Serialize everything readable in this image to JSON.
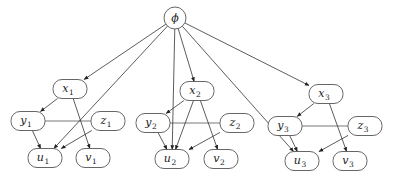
{
  "diagram": {
    "type": "graphical-model",
    "root": {
      "id": "phi",
      "label": "ϕ",
      "x": 175,
      "y": 18,
      "r": 11
    },
    "nodes": [
      {
        "id": "x1",
        "base": "x",
        "sub": "1",
        "x": 70,
        "y": 89
      },
      {
        "id": "y1",
        "base": "y",
        "sub": "1",
        "x": 28,
        "y": 121
      },
      {
        "id": "z1",
        "base": "z",
        "sub": "1",
        "x": 108,
        "y": 121
      },
      {
        "id": "u1",
        "base": "u",
        "sub": "1",
        "x": 45,
        "y": 158
      },
      {
        "id": "v1",
        "base": "v",
        "sub": "1",
        "x": 93,
        "y": 158
      },
      {
        "id": "x2",
        "base": "x",
        "sub": "2",
        "x": 197,
        "y": 91
      },
      {
        "id": "y2",
        "base": "y",
        "sub": "2",
        "x": 153,
        "y": 123
      },
      {
        "id": "z2",
        "base": "z",
        "sub": "2",
        "x": 237,
        "y": 123
      },
      {
        "id": "u2",
        "base": "u",
        "sub": "2",
        "x": 172,
        "y": 159
      },
      {
        "id": "v2",
        "base": "v",
        "sub": "2",
        "x": 221,
        "y": 159
      },
      {
        "id": "x3",
        "base": "x",
        "sub": "3",
        "x": 326,
        "y": 94
      },
      {
        "id": "y3",
        "base": "y",
        "sub": "3",
        "x": 285,
        "y": 126
      },
      {
        "id": "z3",
        "base": "z",
        "sub": "3",
        "x": 365,
        "y": 126
      },
      {
        "id": "u3",
        "base": "u",
        "sub": "3",
        "x": 302,
        "y": 161
      },
      {
        "id": "v3",
        "base": "v",
        "sub": "3",
        "x": 350,
        "y": 161
      }
    ],
    "directed_edges": [
      [
        "phi",
        "x1"
      ],
      [
        "phi",
        "u1"
      ],
      [
        "phi",
        "x2"
      ],
      [
        "phi",
        "u2"
      ],
      [
        "phi",
        "x3"
      ],
      [
        "phi",
        "u3"
      ],
      [
        "x1",
        "y1"
      ],
      [
        "x1",
        "v1"
      ],
      [
        "y1",
        "u1"
      ],
      [
        "z1",
        "u1"
      ],
      [
        "x2",
        "y2"
      ],
      [
        "x2",
        "v2"
      ],
      [
        "x2",
        "u2"
      ],
      [
        "y2",
        "u2"
      ],
      [
        "z2",
        "u2"
      ],
      [
        "x3",
        "y3"
      ],
      [
        "x3",
        "v3"
      ],
      [
        "y3",
        "u3"
      ],
      [
        "z3",
        "u3"
      ]
    ],
    "undirected_edges": [
      [
        "y1",
        "z1"
      ],
      [
        "y2",
        "z2"
      ],
      [
        "y3",
        "z3"
      ]
    ]
  }
}
